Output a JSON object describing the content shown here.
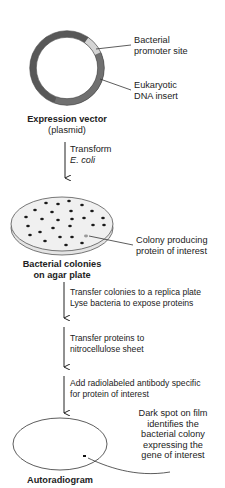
{
  "diagram": {
    "type": "flowchart",
    "title": "",
    "plasmid": {
      "label_line1": "Expression vector",
      "label_line2": "(plasmid)",
      "callouts": {
        "promoter": [
          "Bacterial",
          "promoter site"
        ],
        "insert": [
          "Eukaryotic",
          "DNA insert"
        ]
      },
      "colors": {
        "backbone": "#585858",
        "promoter": "#d4d4d4",
        "insert": "#707070"
      }
    },
    "step1": {
      "line1": "Transform",
      "line2": "E. coli"
    },
    "plate": {
      "label_line1": "Bacterial colonies",
      "label_line2": "on agar plate",
      "callout": [
        "Colony producing",
        "protein of interest"
      ],
      "colors": {
        "fill": "#ececec",
        "colony": "#1a1a1a",
        "target_colony": "#9a9a9a"
      }
    },
    "step2": {
      "line1": "Transfer colonies to a replica plate",
      "line2": "Lyse bacteria to expose proteins"
    },
    "step3": {
      "line1": "Transfer proteins to",
      "line2": "nitrocellulose sheet"
    },
    "step4": {
      "line1": "Add radiolabeled antibody specific",
      "line2": "for protein of interest"
    },
    "autoradiogram": {
      "label": "Autoradiogram",
      "callout": [
        "Dark spot on film",
        "identifies the",
        "bacterial colony",
        "expressing the",
        "gene of interest"
      ]
    }
  }
}
